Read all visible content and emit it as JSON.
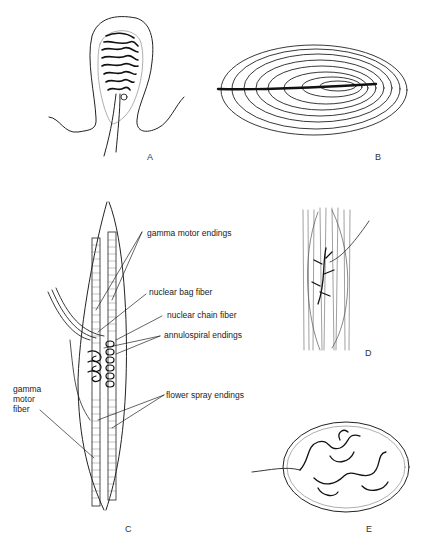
{
  "figure": {
    "panels": [
      {
        "id": "A",
        "letter": "A",
        "description": "encapsulated coiled nerve ending (Ruffini-type)"
      },
      {
        "id": "B",
        "letter": "B",
        "description": "lamellated corpuscle (Pacinian) with central axon"
      },
      {
        "id": "C",
        "letter": "C",
        "description": "muscle spindle with intrafusal fibers"
      },
      {
        "id": "D",
        "letter": "D",
        "description": "branching nerve ending among fibers (Golgi tendon organ)"
      },
      {
        "id": "E",
        "letter": "E",
        "description": "encapsulated ending with tangled nerve terminals"
      }
    ],
    "labels_c": {
      "gamma_motor_endings": "gamma motor endings",
      "nuclear_bag_fiber": "nuclear bag fiber",
      "nuclear_chain_fiber": "nuclear chain fiber",
      "annulospiral_endings": "annulospiral endings",
      "flower_spray_endings": "flower spray endings",
      "gamma_motor_fiber": "gamma\nmotor\nfiber"
    },
    "colors": {
      "ink": "#222222",
      "background": "#ffffff"
    }
  }
}
